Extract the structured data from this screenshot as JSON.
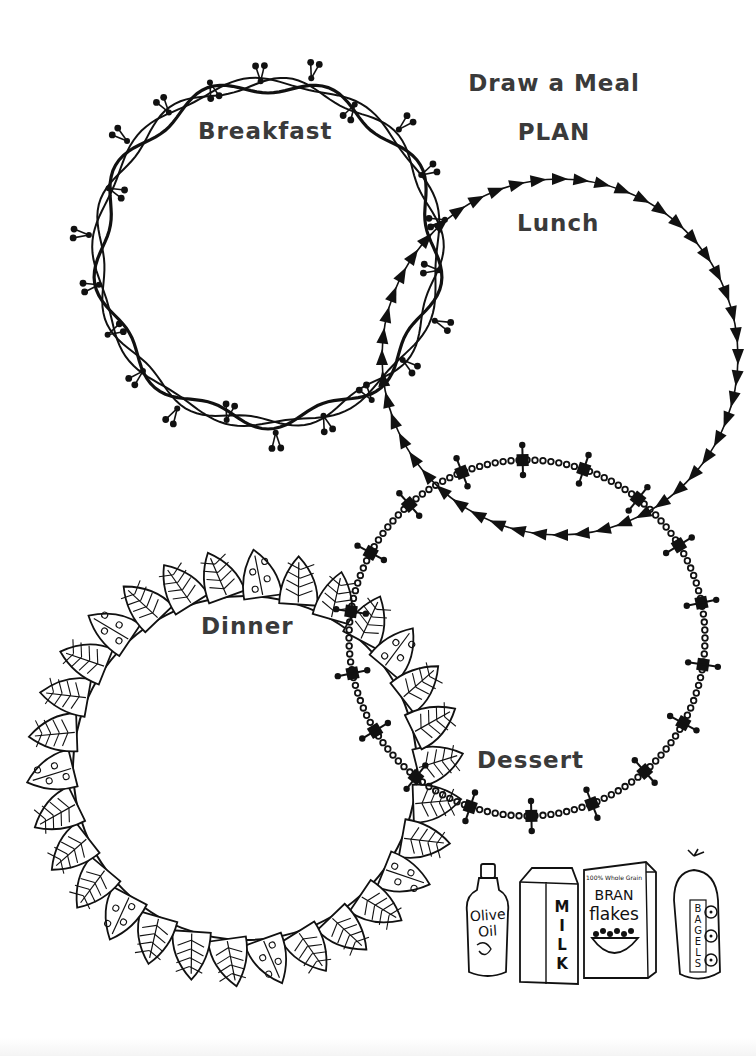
{
  "title": {
    "line1": "Draw a Meal",
    "line2": "PLAN"
  },
  "meals": [
    {
      "id": "breakfast",
      "label": "Breakfast",
      "frame_style": "thorny-vine",
      "center": [
        268,
        253
      ],
      "radius": 178
    },
    {
      "id": "lunch",
      "label": "Lunch",
      "frame_style": "triangle-arrows",
      "center": [
        560,
        357
      ],
      "radius": 178
    },
    {
      "id": "dessert",
      "label": "Dessert",
      "frame_style": "beaded-crosses",
      "center": [
        527,
        638
      ],
      "radius": 178
    },
    {
      "id": "dinner",
      "label": "Dinner",
      "frame_style": "leaf-wreath",
      "center": [
        245,
        768
      ],
      "radius": 172
    }
  ],
  "groceries": [
    {
      "id": "olive-oil",
      "label_lines": [
        "Olive",
        "Oil"
      ]
    },
    {
      "id": "milk",
      "label_lines": [
        "M",
        "I",
        "L",
        "K"
      ]
    },
    {
      "id": "bran-flakes",
      "label_lines": [
        "BRAN",
        "flakes"
      ],
      "subtext": "100% Whole Grain"
    },
    {
      "id": "bagels",
      "label_lines": [
        "B",
        "A",
        "G",
        "E",
        "L",
        "S"
      ]
    }
  ],
  "colors": {
    "ink": "#111111",
    "label_text": "#3a3a3a",
    "paper": "#ffffff"
  }
}
